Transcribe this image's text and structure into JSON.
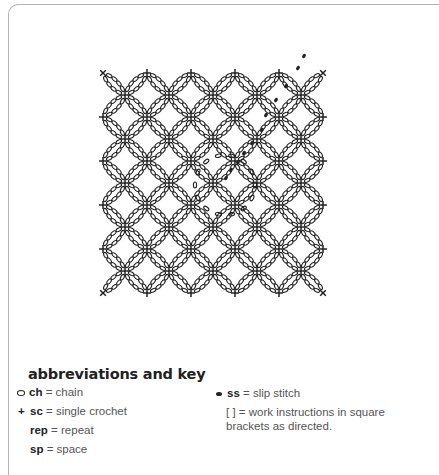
{
  "diagram": {
    "type": "crochet-chart",
    "colors": {
      "ink": "#222222",
      "frame": "#b5b5b5"
    },
    "lattice": {
      "center_x": 213,
      "center_y": 183,
      "spacing": 44,
      "radius": 176,
      "chains_per_arc": 4
    },
    "center_ring": {
      "cx": 225,
      "cy": 185,
      "radius": 30,
      "chains": 14
    },
    "slip_stitches": [
      [
        226,
        178
      ],
      [
        231,
        170
      ],
      [
        238,
        162
      ],
      [
        244,
        153
      ],
      [
        252,
        143
      ],
      [
        262,
        130
      ],
      [
        266,
        115
      ],
      [
        276,
        100
      ],
      [
        286,
        86
      ],
      [
        298,
        68
      ],
      [
        304,
        56
      ]
    ]
  },
  "legend": {
    "title": "abbreviations and key",
    "items": [
      {
        "symbol": "chain-oval",
        "abbr": "ch",
        "text": "= chain"
      },
      {
        "symbol": "plus",
        "abbr": "sc",
        "text": "= single crochet"
      },
      {
        "symbol": "",
        "abbr": "rep",
        "text": "= repeat"
      },
      {
        "symbol": "",
        "abbr": "sp",
        "text": "= space"
      },
      {
        "symbol": "filled-dot",
        "abbr": "ss",
        "text": "= slip stitch"
      },
      {
        "symbol": "",
        "abbr": "[ ]",
        "text": "= work instructions in square"
      },
      {
        "symbol": "",
        "abbr": "",
        "text": "brackets as directed."
      }
    ],
    "plus_glyph": "+"
  }
}
